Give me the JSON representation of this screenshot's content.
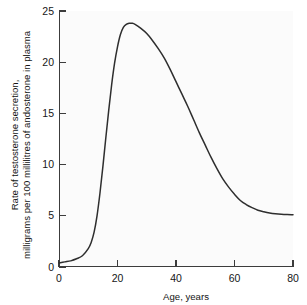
{
  "chart_data": {
    "type": "line",
    "title": "",
    "xlabel": "Age, years",
    "ylabel_line1": "Rate of testosterone secretion,",
    "ylabel_line2": "milligrams per 100 millilitres of andosterone in plasma",
    "ylabel": "Rate of testosterone secretion, milligrams per 100 millilitres of andosterone in plasma",
    "xlim": [
      0,
      80
    ],
    "ylim": [
      0,
      25
    ],
    "xticks": [
      0,
      20,
      40,
      60,
      80
    ],
    "yticks": [
      0,
      5,
      10,
      15,
      20,
      25
    ],
    "xtick_labels": [
      "0",
      "20",
      "40",
      "60",
      "80"
    ],
    "ytick_labels": [
      "0",
      "5",
      "10",
      "15",
      "20",
      "25"
    ],
    "grid": false,
    "legend": null,
    "series": [
      {
        "name": "Testosterone secretion rate",
        "color": "#2e2e2e",
        "x": [
          0,
          2,
          4,
          6,
          8,
          10,
          11,
          12,
          13,
          14,
          15,
          16,
          17,
          18,
          19,
          20,
          21,
          22,
          23,
          24,
          25,
          26,
          28,
          30,
          32,
          34,
          36,
          38,
          40,
          42,
          44,
          46,
          48,
          50,
          52,
          54,
          56,
          58,
          60,
          62,
          64,
          66,
          68,
          70,
          72,
          74,
          76,
          78,
          80
        ],
        "y": [
          0.4,
          0.5,
          0.6,
          0.8,
          1.1,
          1.8,
          2.4,
          3.4,
          5.0,
          7.2,
          9.8,
          12.6,
          15.3,
          17.8,
          19.9,
          21.5,
          22.7,
          23.4,
          23.7,
          23.8,
          23.8,
          23.7,
          23.3,
          22.8,
          22.1,
          21.3,
          20.4,
          19.3,
          18.1,
          16.9,
          15.7,
          14.4,
          13.1,
          11.9,
          10.7,
          9.6,
          8.6,
          7.8,
          7.1,
          6.5,
          6.1,
          5.8,
          5.55,
          5.4,
          5.28,
          5.2,
          5.15,
          5.12,
          5.1
        ]
      }
    ],
    "annotations": [],
    "peak": {
      "x": 24,
      "y": 23.8
    },
    "axis_color": "#3c3c3c",
    "plot_background": "#fbfbfb",
    "figure_background": "#ffffff"
  }
}
